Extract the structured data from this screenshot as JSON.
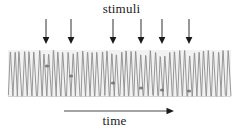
{
  "figure": {
    "title_label": "stimuli",
    "axis_label": "time",
    "background_color": "#ffffff",
    "trace_color": "#8c8c8c",
    "marker_color": "#6e6e6e",
    "arrow_color": "#1a1a1a",
    "band_color": "#f2f2f2",
    "text_color": "#1a1a1a"
  },
  "chart_data": {
    "type": "line",
    "title": "stimuli",
    "xlabel": "time",
    "ylabel": "",
    "grid": false,
    "legend": null,
    "axes": {
      "x_range": [
        0,
        237
      ],
      "y_range": [
        50,
        97
      ],
      "x_axis_visible": false,
      "y_axis_visible": false
    },
    "trace": {
      "name": "oscillation",
      "x_start": 8,
      "x_end": 231,
      "y_top": 50,
      "y_bottom": 97,
      "cycle_count": 46,
      "stroke_color": "#8c8c8c",
      "stroke_width": 0.9
    },
    "stimulus_arrows": [
      {
        "index": 1,
        "x": 46,
        "tip_y": 44,
        "tail_y": 19
      },
      {
        "index": 2,
        "x": 71,
        "tip_y": 44,
        "tail_y": 19
      },
      {
        "index": 3,
        "x": 113,
        "tip_y": 44,
        "tail_y": 19
      },
      {
        "index": 4,
        "x": 141,
        "tip_y": 44,
        "tail_y": 19
      },
      {
        "index": 5,
        "x": 162,
        "tip_y": 44,
        "tail_y": 19
      },
      {
        "index": 6,
        "x": 189,
        "tip_y": 44,
        "tail_y": 19
      }
    ],
    "response_markers": [
      {
        "x": 47,
        "y": 66
      },
      {
        "x": 71,
        "y": 76
      },
      {
        "x": 113,
        "y": 83
      },
      {
        "x": 141,
        "y": 88
      },
      {
        "x": 162,
        "y": 90
      },
      {
        "x": 189,
        "y": 91
      }
    ],
    "time_axis_arrow": {
      "x_start": 64,
      "x_end": 174,
      "y": 111
    }
  }
}
